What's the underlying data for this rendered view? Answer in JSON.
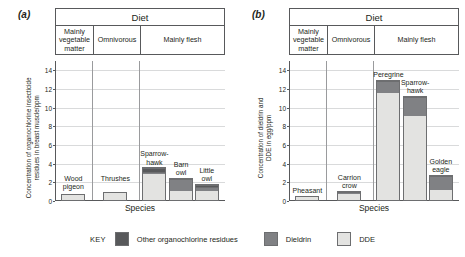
{
  "figure": {
    "xlabel": "Species",
    "diet_title": "Diet",
    "diet_categories": [
      "Mainly\nvegetable\nmatter",
      "Omnivorous",
      "Mainly flesh"
    ]
  },
  "key": {
    "label": "KEY",
    "items": [
      {
        "name": "Other organochlorine residues",
        "color": "#58595b"
      },
      {
        "name": "Dieldrin",
        "color": "#808184"
      },
      {
        "name": "DDE",
        "color": "#e3e3e1"
      }
    ]
  },
  "panel_a": {
    "letter": "(a)",
    "ylabel_line1": "Concentration of organochlorine insecticide",
    "ylabel_line2": "residues in breast muscle/ppm"
  },
  "panel_b": {
    "letter": "(b)",
    "ylabel_line1": "Concentration of dieldrin and",
    "ylabel_line2": "DDE in egg/ppm"
  },
  "chart_data": [
    {
      "type": "bar",
      "panel": "(a)",
      "title": "Diet",
      "xlabel": "Species",
      "ylabel": "Concentration of organochlorine insecticide residues in breast muscle/ppm",
      "ylim": [
        0,
        15
      ],
      "yticks": [
        0,
        2,
        4,
        6,
        8,
        10,
        12,
        14
      ],
      "grid": true,
      "stacked": true,
      "series": [
        {
          "name": "DDE",
          "color": "#e3e3e1",
          "values": [
            0.8,
            1.0,
            2.95,
            1.1,
            1.1
          ]
        },
        {
          "name": "Dieldrin",
          "color": "#808184",
          "values": [
            0.0,
            0.0,
            0.3,
            1.4,
            0.45
          ]
        },
        {
          "name": "Other organochlorine residues",
          "color": "#58595b",
          "values": [
            0.0,
            0.0,
            0.35,
            0.0,
            0.25
          ]
        }
      ],
      "categories": [
        "Wood\npigeon",
        "Thrushes",
        "Sparrow-\nhawk",
        "Barn\nowl",
        "Little\nowl"
      ],
      "totals": [
        0.8,
        1.0,
        3.6,
        2.5,
        1.8
      ],
      "diet_groups": [
        {
          "label": "Mainly vegetable matter",
          "species": [
            "Wood pigeon"
          ]
        },
        {
          "label": "Omnivorous",
          "species": [
            "Thrushes"
          ]
        },
        {
          "label": "Mainly flesh",
          "species": [
            "Sparrow-hawk",
            "Barn owl",
            "Little owl"
          ]
        }
      ]
    },
    {
      "type": "bar",
      "panel": "(b)",
      "title": "Diet",
      "xlabel": "Species",
      "ylabel": "Concentration of dieldrin and DDE in egg/ppm",
      "ylim": [
        0,
        15
      ],
      "yticks": [
        0,
        2,
        4,
        6,
        8,
        10,
        12,
        14
      ],
      "grid": true,
      "stacked": true,
      "series": [
        {
          "name": "DDE",
          "color": "#e3e3e1",
          "values": [
            0.5,
            0.8,
            11.7,
            9.2,
            1.2
          ]
        },
        {
          "name": "Dieldrin",
          "color": "#808184",
          "values": [
            0.0,
            0.25,
            1.3,
            2.1,
            1.6
          ]
        }
      ],
      "categories": [
        "Pheasant",
        "Carrion\ncrow",
        "Peregrine",
        "Sparrow-\nhawk",
        "Golden\neagle"
      ],
      "totals": [
        0.5,
        1.05,
        13.0,
        11.3,
        2.8
      ],
      "diet_groups": [
        {
          "label": "Mainly vegetable matter",
          "species": [
            "Pheasant"
          ]
        },
        {
          "label": "Omnivorous",
          "species": [
            "Carrion crow"
          ]
        },
        {
          "label": "Mainly flesh",
          "species": [
            "Peregrine",
            "Sparrow-hawk",
            "Golden eagle"
          ]
        }
      ]
    }
  ]
}
